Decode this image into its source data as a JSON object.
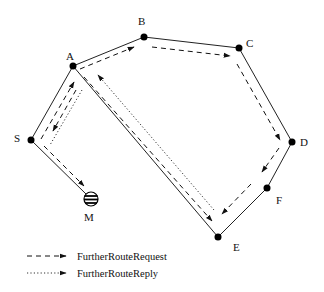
{
  "diagram": {
    "nodes": [
      {
        "id": "A",
        "label": "A"
      },
      {
        "id": "B",
        "label": "B"
      },
      {
        "id": "C",
        "label": "C"
      },
      {
        "id": "D",
        "label": "D"
      },
      {
        "id": "E",
        "label": "E"
      },
      {
        "id": "F",
        "label": "F"
      },
      {
        "id": "S",
        "label": "S"
      },
      {
        "id": "M",
        "label": "M"
      }
    ],
    "edges": [
      [
        "S",
        "A"
      ],
      [
        "A",
        "B"
      ],
      [
        "B",
        "C"
      ],
      [
        "C",
        "D"
      ],
      [
        "D",
        "F"
      ],
      [
        "F",
        "E"
      ],
      [
        "A",
        "E"
      ],
      [
        "S",
        "M"
      ]
    ],
    "request_path": [
      "S",
      "A",
      "B",
      "C",
      "D",
      "F",
      "E",
      "A",
      "S",
      "M"
    ],
    "reply_path": [
      "E",
      "A",
      "S"
    ],
    "legend": {
      "request_label": "FurtherRouteRequest",
      "reply_label": "FurtherRouteReply"
    }
  }
}
